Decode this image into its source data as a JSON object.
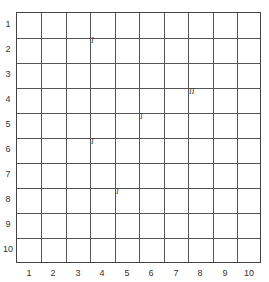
{
  "grid": {
    "rows": 10,
    "cols": 10,
    "row_labels": [
      "1",
      "2",
      "3",
      "4",
      "5",
      "6",
      "7",
      "8",
      "9",
      "10"
    ],
    "col_labels": [
      "1",
      "2",
      "3",
      "4",
      "5",
      "6",
      "7",
      "8",
      "9",
      "10"
    ]
  },
  "marks": [
    {
      "label": "I",
      "col": 4,
      "row": 2,
      "x": 91,
      "y": 36
    },
    {
      "label": "II",
      "col": 8,
      "row": 4,
      "x": 189,
      "y": 87
    },
    {
      "label": "I",
      "col": 6,
      "row": 5,
      "x": 140,
      "y": 112
    },
    {
      "label": "I",
      "col": 4,
      "row": 6,
      "x": 91,
      "y": 137
    },
    {
      "label": "I",
      "col": 5,
      "row": 8,
      "x": 116,
      "y": 187
    }
  ]
}
